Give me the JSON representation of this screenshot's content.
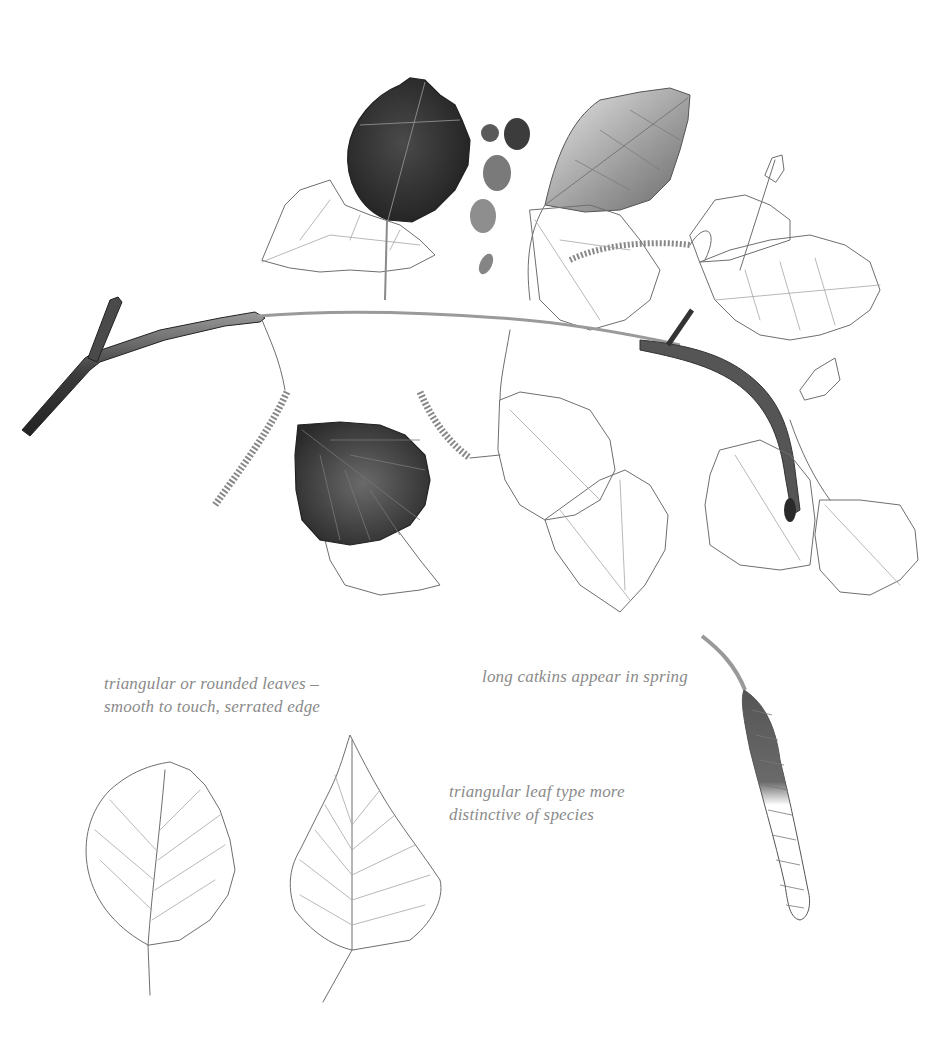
{
  "illustration": {
    "subject": "birch branch with leaves and catkins",
    "palette": {
      "background": "#ffffff",
      "ink": "#6e6e6e",
      "dark_leaf": "#2e2e2e",
      "mid_leaf": "#8c8c8c",
      "caption": "#8a8a8a"
    },
    "swatches": [
      "#5a5a5a",
      "#3c3c3c",
      "#7a7a7a",
      "#8e8e8e",
      "#858585"
    ]
  },
  "captions": {
    "leaves": {
      "line1": "triangular or rounded leaves –",
      "line2": "smooth to touch, serrated edge"
    },
    "catkins": {
      "line1": "long catkins appear in spring"
    },
    "triangular": {
      "line1": "triangular leaf type more",
      "line2": "distinctive of species"
    }
  }
}
